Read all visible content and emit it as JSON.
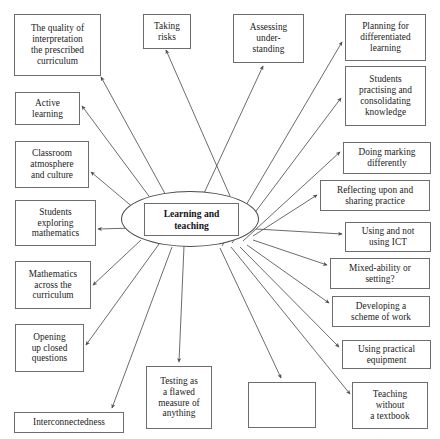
{
  "diagram": {
    "title": "Learning and teaching",
    "center": {
      "label": "Learning and\nteaching",
      "label_line1": "Learning and",
      "label_line2": "teaching"
    },
    "style": {
      "background": "#ffffff",
      "box_border": "#6d6d6d",
      "ellipse_border": "#4a4a4a",
      "edge_color": "#5a5a5a",
      "text_color": "#1b1b1b"
    },
    "nodes": [
      {
        "id": "quality-of-interpretation",
        "label": "The quality of\ninterpretation\nthe prescribed\ncurriculum",
        "x": 14,
        "y": 14,
        "w": 87,
        "h": 62
      },
      {
        "id": "taking-risks",
        "label": "Taking\nrisks",
        "x": 143,
        "y": 14,
        "w": 48,
        "h": 35
      },
      {
        "id": "assessing-understanding",
        "label": "Assessing\nunder-\nstanding",
        "x": 233,
        "y": 14,
        "w": 71,
        "h": 49
      },
      {
        "id": "planning-for-differentiated-learning",
        "label": "Planning for\ndifferentiated\nlearning",
        "x": 345,
        "y": 14,
        "w": 81,
        "h": 47
      },
      {
        "id": "students-practising-and-consolidating-knowledge",
        "label": "Students\npractising and\nconsolidating\nknowledge",
        "x": 345,
        "y": 66,
        "w": 81,
        "h": 60
      },
      {
        "id": "active-learning",
        "label": "Active\nlearning",
        "x": 15,
        "y": 92,
        "w": 65,
        "h": 33
      },
      {
        "id": "doing-marking-differently",
        "label": "Doing marking\ndifferently",
        "x": 343,
        "y": 142,
        "w": 88,
        "h": 32
      },
      {
        "id": "classroom-atmosphere-and-culture",
        "label": "Classroom\natmosphere\nand culture",
        "x": 15,
        "y": 141,
        "w": 74,
        "h": 47
      },
      {
        "id": "reflecting-upon-and-sharing-practice",
        "label": "Reflecting upon and\nsharing practice",
        "x": 320,
        "y": 180,
        "w": 110,
        "h": 31
      },
      {
        "id": "students-exploring-mathematics",
        "label": "Students\nexploring\nmathematics",
        "x": 15,
        "y": 200,
        "w": 81,
        "h": 46
      },
      {
        "id": "using-and-not-using-ict",
        "label": "Using and not\nusing ICT",
        "x": 345,
        "y": 222,
        "w": 86,
        "h": 30
      },
      {
        "id": "mixed-ability-or-setting",
        "label": "Mixed-ability or\nsetting?",
        "x": 330,
        "y": 258,
        "w": 100,
        "h": 31
      },
      {
        "id": "mathematics-across-the-curriculum",
        "label": "Mathematics\nacross the\ncurriculum",
        "x": 15,
        "y": 261,
        "w": 76,
        "h": 48
      },
      {
        "id": "developing-a-scheme-of-work",
        "label": "Developing a\nscheme of work",
        "x": 332,
        "y": 296,
        "w": 98,
        "h": 31
      },
      {
        "id": "opening-up-closed-questions",
        "label": "Opening\nup closed\nquestions",
        "x": 15,
        "y": 324,
        "w": 69,
        "h": 48
      },
      {
        "id": "using-practical-equipment",
        "label": "Using practical\nequipment",
        "x": 342,
        "y": 340,
        "w": 89,
        "h": 29
      },
      {
        "id": "testing-as-a-flawed-measure",
        "label": "Testing as\na flawed\nmeasure of\nanything",
        "x": 146,
        "y": 366,
        "w": 66,
        "h": 63
      },
      {
        "id": "teaching-without-a-textbook",
        "label": "Teaching\nwithout\na textbook",
        "x": 352,
        "y": 382,
        "w": 76,
        "h": 47
      },
      {
        "id": "interconnectedness",
        "label": "Interconnectedness",
        "x": 14,
        "y": 412,
        "w": 110,
        "h": 21
      },
      {
        "id": "unlabelled-blank-node",
        "label": "",
        "x": 248,
        "y": 382,
        "w": 68,
        "h": 46
      }
    ],
    "edges": [
      {
        "from": "center",
        "to": "quality-of-interpretation",
        "x1": 174,
        "y1": 210,
        "x2": 101,
        "y2": 77
      },
      {
        "from": "center",
        "to": "taking-risks",
        "x1": 230,
        "y1": 196,
        "x2": 166,
        "y2": 50
      },
      {
        "from": "center",
        "to": "assessing-understanding",
        "x1": 180,
        "y1": 245,
        "x2": 263,
        "y2": 66
      },
      {
        "from": "center",
        "to": "planning-for-differentiated-learning",
        "x1": 222,
        "y1": 246,
        "x2": 342,
        "y2": 42
      },
      {
        "from": "center",
        "to": "students-practising-and-consolidating-knowledge",
        "x1": 232,
        "y1": 243,
        "x2": 341,
        "y2": 98
      },
      {
        "from": "center",
        "to": "active-learning",
        "x1": 160,
        "y1": 211,
        "x2": 82,
        "y2": 106
      },
      {
        "from": "center",
        "to": "doing-marking-differently",
        "x1": 243,
        "y1": 241,
        "x2": 340,
        "y2": 152
      },
      {
        "from": "center",
        "to": "classroom-atmosphere-and-culture",
        "x1": 141,
        "y1": 214,
        "x2": 91,
        "y2": 172
      },
      {
        "from": "center",
        "to": "reflecting-upon-and-sharing-practice",
        "x1": 253,
        "y1": 236,
        "x2": 317,
        "y2": 195
      },
      {
        "from": "center",
        "to": "students-exploring-mathematics",
        "x1": 135,
        "y1": 228,
        "x2": 98,
        "y2": 229
      },
      {
        "from": "center",
        "to": "using-and-not-using-ict",
        "x1": 256,
        "y1": 229,
        "x2": 342,
        "y2": 234
      },
      {
        "from": "center",
        "to": "mixed-ability-or-setting",
        "x1": 253,
        "y1": 240,
        "x2": 327,
        "y2": 265
      },
      {
        "from": "center",
        "to": "mathematics-across-the-curriculum",
        "x1": 141,
        "y1": 240,
        "x2": 93,
        "y2": 285
      },
      {
        "from": "center",
        "to": "developing-a-scheme-of-work",
        "x1": 247,
        "y1": 245,
        "x2": 329,
        "y2": 303
      },
      {
        "from": "center",
        "to": "opening-up-closed-questions",
        "x1": 159,
        "y1": 244,
        "x2": 86,
        "y2": 345
      },
      {
        "from": "center",
        "to": "using-practical-equipment",
        "x1": 240,
        "y1": 247,
        "x2": 339,
        "y2": 347
      },
      {
        "from": "center",
        "to": "testing-as-a-flawed-measure",
        "x1": 184,
        "y1": 246,
        "x2": 179,
        "y2": 362
      },
      {
        "from": "center",
        "to": "teaching-without-a-textbook",
        "x1": 231,
        "y1": 247,
        "x2": 350,
        "y2": 394
      },
      {
        "from": "center",
        "to": "interconnectedness",
        "x1": 172,
        "y1": 247,
        "x2": 112,
        "y2": 408
      },
      {
        "from": "center",
        "to": "unlabelled-blank-node",
        "x1": 220,
        "y1": 248,
        "x2": 281,
        "y2": 378
      }
    ]
  }
}
